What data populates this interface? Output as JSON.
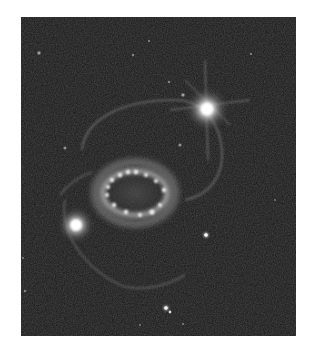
{
  "image": {
    "subject": "supernova remnant triple-ring system",
    "colormode": "grayscale",
    "background_color": "#1c1c1c",
    "frame_color": "#ffffff",
    "bounds": {
      "left": 21,
      "top": 17,
      "width": 275,
      "height": 319
    },
    "features": [
      {
        "name": "central-ring",
        "cx": 110,
        "cy": 172,
        "rx": 58,
        "ry": 35
      },
      {
        "name": "bright-star-upper-right",
        "cx": 186,
        "cy": 94,
        "r": 12
      },
      {
        "name": "bright-star-lower-left",
        "cx": 56,
        "cy": 210,
        "r": 10
      },
      {
        "name": "outer-ring-upper",
        "description": "faint arc from upper-left through bright upper-right star"
      },
      {
        "name": "outer-ring-lower",
        "description": "faint arc below central ring"
      },
      {
        "name": "star-lower-center",
        "cx": 147,
        "cy": 293,
        "r": 4
      },
      {
        "name": "star-right",
        "cx": 184,
        "cy": 218,
        "r": 4
      }
    ]
  }
}
